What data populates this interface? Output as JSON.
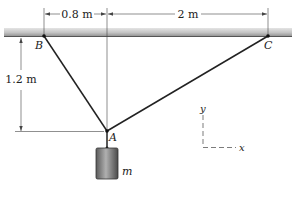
{
  "diagram": {
    "dimensions": {
      "horizontal_left": "0.8 m",
      "horizontal_right": "2 m",
      "vertical": "1.2 m"
    },
    "points": {
      "B": "B",
      "C": "C",
      "A": "A"
    },
    "mass_label": "m",
    "axes": {
      "x": "x",
      "y": "y"
    },
    "colors": {
      "ceiling_top": "#9a9a9a",
      "ceiling_bottom": "#d8d8d8",
      "cable": "#222222",
      "mass_dark": "#4a4a4a",
      "mass_light": "#a8a8a8"
    }
  }
}
